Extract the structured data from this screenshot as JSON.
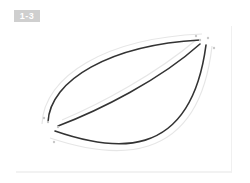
{
  "figure": {
    "label": "1-3",
    "badge_color": "#cfcfcf",
    "stroke_color": "#333333",
    "guide_color": "#e6e6e6",
    "point_color": "#c8c8c8"
  },
  "shape": {
    "description": "leaf-shaped figure formed by three curves",
    "curves": [
      {
        "name": "upper-curve",
        "path": "M 48 122 C 50 80, 110 45, 200 40"
      },
      {
        "name": "diagonal-curve",
        "path": "M 58 126 C 100 110, 160 80, 200 44"
      },
      {
        "name": "lower-curve",
        "path": "M 55 131 C 110 150, 190 165, 206 45"
      }
    ],
    "guides": [
      {
        "name": "upper-guide",
        "path": "M 42 124 C 44 76, 106 38, 202 34"
      },
      {
        "name": "diagonal-guide",
        "path": "M 62 120 C 100 104, 156 74, 196 40"
      },
      {
        "name": "lower-guide",
        "path": "M 50 138 C 110 158, 198 170, 212 46"
      }
    ],
    "points": [
      {
        "x": 200,
        "y": 40
      },
      {
        "x": 208,
        "y": 38
      },
      {
        "x": 196,
        "y": 36
      },
      {
        "x": 48,
        "y": 122
      },
      {
        "x": 44,
        "y": 118
      },
      {
        "x": 58,
        "y": 127
      },
      {
        "x": 54,
        "y": 142
      },
      {
        "x": 214,
        "y": 48
      }
    ]
  }
}
